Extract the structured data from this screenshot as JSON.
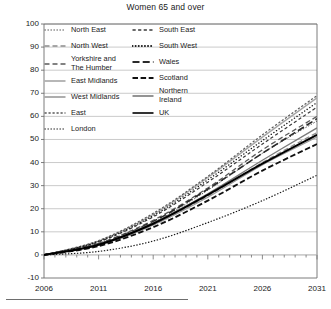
{
  "chart_data": {
    "type": "line",
    "title": "Women 65 and over",
    "xlabel": "",
    "ylabel": "",
    "xlim": [
      2006,
      2031
    ],
    "ylim": [
      -10,
      100
    ],
    "ytick_labels": [
      "100",
      "90",
      "80",
      "70",
      "60",
      "50",
      "40",
      "30",
      "20",
      "10",
      "0",
      "-10"
    ],
    "ytick_values": [
      100,
      90,
      80,
      70,
      60,
      50,
      40,
      30,
      20,
      10,
      0,
      -10
    ],
    "xtick_labels": [
      "2006",
      "2011",
      "2016",
      "2021",
      "2026",
      "2031"
    ],
    "xtick_values": [
      2006,
      2011,
      2016,
      2021,
      2026,
      2031
    ],
    "grid": "horizontal",
    "legend_position": "top-left-inside",
    "x": [
      2006,
      2011,
      2016,
      2021,
      2026,
      2031
    ],
    "series": [
      {
        "name": "North East",
        "values": [
          0,
          4.5,
          14.0,
          28.0,
          44.0,
          58.0
        ],
        "style": "dotted-fine",
        "color": "#4d4d4d",
        "width": 1.0
      },
      {
        "name": "North West",
        "values": [
          0,
          4.0,
          13.0,
          25.5,
          40.0,
          53.0
        ],
        "style": "dashed-long",
        "color": "#8c8c8c",
        "width": 1.3
      },
      {
        "name": "Yorkshire and\nThe Humber",
        "values": [
          0,
          5.0,
          15.0,
          29.0,
          45.5,
          60.0
        ],
        "style": "dashed-long",
        "color": "#5a5a5a",
        "width": 1.3
      },
      {
        "name": "East Midlands",
        "values": [
          0,
          6.0,
          17.5,
          33.5,
          51.0,
          68.0
        ],
        "style": "solid",
        "color": "#a6a6a6",
        "width": 1.4
      },
      {
        "name": "West Midlands",
        "values": [
          0,
          4.2,
          13.0,
          25.0,
          39.0,
          51.0
        ],
        "style": "solid",
        "color": "#9a9a9a",
        "width": 1.2
      },
      {
        "name": "East",
        "values": [
          0,
          6.2,
          18.0,
          34.0,
          52.0,
          69.0
        ],
        "style": "dashed-short",
        "color": "#5a5a5a",
        "width": 1.2
      },
      {
        "name": "London",
        "values": [
          0,
          1.5,
          6.0,
          14.0,
          23.5,
          34.5
        ],
        "style": "dotted-fine",
        "color": "#1a1a1a",
        "width": 1.2
      },
      {
        "name": "South East",
        "values": [
          0,
          5.6,
          16.5,
          31.5,
          48.0,
          64.0
        ],
        "style": "dashed-med",
        "color": "#3a3a3a",
        "width": 1.2
      },
      {
        "name": "South West",
        "values": [
          0,
          5.8,
          17.0,
          32.5,
          49.5,
          66.0
        ],
        "style": "dotted-round",
        "color": "#1a1a1a",
        "width": 1.4
      },
      {
        "name": "Wales",
        "values": [
          0,
          4.8,
          14.5,
          28.5,
          44.0,
          59.0
        ],
        "style": "dashed-xlong",
        "color": "#2a2a2a",
        "width": 1.6
      },
      {
        "name": "Scotland",
        "values": [
          0,
          3.8,
          12.0,
          23.5,
          36.5,
          48.0
        ],
        "style": "dashed-thick",
        "color": "#111111",
        "width": 1.8
      },
      {
        "name": "Northern\nIreland",
        "values": [
          0,
          4.6,
          14.0,
          26.5,
          41.0,
          55.0
        ],
        "style": "solid",
        "color": "#7a7a7a",
        "width": 1.3
      },
      {
        "name": "UK",
        "values": [
          0,
          4.4,
          13.5,
          26.0,
          39.5,
          52.0
        ],
        "style": "solid",
        "color": "#000000",
        "width": 2.0
      }
    ]
  },
  "legend": {
    "columns": [
      {
        "items": [
          {
            "label": "North East",
            "style": "dotted-fine",
            "color": "#4d4d4d"
          },
          {
            "label": "North West",
            "style": "dashed-long",
            "color": "#8c8c8c"
          },
          {
            "label": "Yorkshire and\nThe Humber",
            "style": "dashed-long",
            "color": "#5a5a5a"
          },
          {
            "label": "East Midlands",
            "style": "solid",
            "color": "#a6a6a6"
          },
          {
            "label": "West Midlands",
            "style": "solid",
            "color": "#9a9a9a"
          },
          {
            "label": "East",
            "style": "dashed-short",
            "color": "#5a5a5a"
          },
          {
            "label": "London",
            "style": "dotted-fine",
            "color": "#1a1a1a"
          }
        ]
      },
      {
        "items": [
          {
            "label": "South East",
            "style": "dashed-med",
            "color": "#3a3a3a"
          },
          {
            "label": "South West",
            "style": "dotted-round",
            "color": "#1a1a1a"
          },
          {
            "label": "Wales",
            "style": "dashed-xlong",
            "color": "#2a2a2a"
          },
          {
            "label": "Scotland",
            "style": "dashed-thick",
            "color": "#111111"
          },
          {
            "label": "Northern\nIreland",
            "style": "solid",
            "color": "#7a7a7a"
          },
          {
            "label": "UK",
            "style": "solid",
            "color": "#000000"
          }
        ]
      }
    ]
  },
  "colors": {
    "axis": "#6e6e6e",
    "grid": "#bdbdbd",
    "text": "#1a1a1a",
    "background": "#ffffff"
  }
}
